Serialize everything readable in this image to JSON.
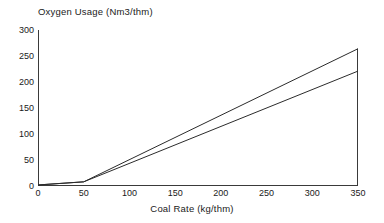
{
  "chart_data": {
    "type": "line",
    "title": "Oxygen Usage (Nm3/thm)",
    "xlabel": "Coal Rate (kg/thm)",
    "ylabel": "Oxygen Usage (Nm3/thm)",
    "xlim": [
      0,
      350
    ],
    "ylim": [
      0,
      300
    ],
    "xticks": [
      0,
      50,
      100,
      150,
      200,
      250,
      300,
      350
    ],
    "yticks": [
      0,
      50,
      100,
      150,
      200,
      250,
      300
    ],
    "grid": false,
    "legend": null,
    "line_color": "#2b2b2b",
    "series": [
      {
        "name": "upper",
        "x": [
          0,
          50,
          350
        ],
        "values": [
          2,
          8,
          264
        ]
      },
      {
        "name": "lower",
        "x": [
          0,
          50,
          350
        ],
        "values": [
          2,
          8,
          221
        ]
      }
    ]
  },
  "axes": {
    "y_tick_labels": [
      "300",
      "250",
      "200",
      "150",
      "100",
      "50",
      "0"
    ],
    "x_tick_labels": [
      "0",
      "50",
      "100",
      "150",
      "200",
      "250",
      "300",
      "350"
    ]
  }
}
